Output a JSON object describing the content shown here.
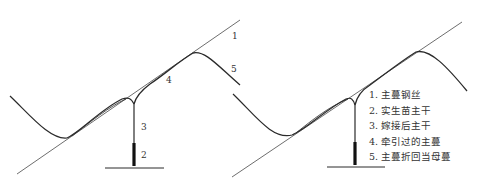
{
  "colors": {
    "line": "#6e6e6e",
    "curve": "#2a2a2a",
    "text": "#333333",
    "background": "#ffffff"
  },
  "left_diagram": {
    "labels": {
      "l1": "1",
      "l2": "2",
      "l3": "3",
      "l4": "4",
      "l5": "5"
    }
  },
  "right_diagram": {
    "legend": [
      {
        "label": "1. 主蔓钢丝"
      },
      {
        "label": "2. 实生苗主干"
      },
      {
        "label": "3. 嫁接后主干"
      },
      {
        "label": "4. 牵引过的主蔓"
      },
      {
        "label": "5. 主蔓折回当母蔓"
      }
    ]
  }
}
